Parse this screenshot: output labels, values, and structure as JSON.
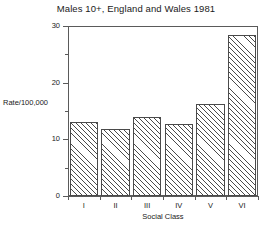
{
  "chart_data": {
    "type": "bar",
    "title": "Males 10+, England and Wales 1981",
    "xlabel": "Social Class",
    "ylabel": "Rate/100,000",
    "categories": [
      "I",
      "II",
      "III",
      "IV",
      "V",
      "VI"
    ],
    "values": [
      13.0,
      11.8,
      14.0,
      12.7,
      16.3,
      28.5
    ],
    "ylim": [
      0,
      30
    ],
    "ytick_labels": [
      "0",
      "10",
      "20",
      "30"
    ],
    "ytick_values": [
      0,
      10,
      20,
      30
    ],
    "yminor_values": [
      5,
      15,
      25
    ],
    "grid": false,
    "legend": null,
    "bar_style": {
      "fill": "diagonal-hatch",
      "edge_color": "#4a4a4a",
      "face_color": "#ffffff"
    },
    "frame": "box"
  },
  "colors": {
    "background": "#ffffff",
    "axis": "#5a5a5a",
    "text": "#1a1a1a",
    "hatch": "#4a4a4a"
  }
}
